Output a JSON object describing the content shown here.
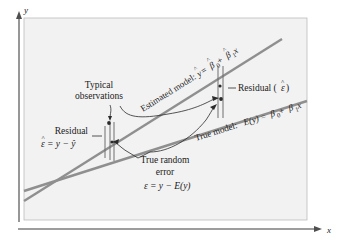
{
  "figure": {
    "background_color": "#ffffff",
    "panel_color": "#f2f2f2",
    "panel_border_color": "#b4b4b4",
    "line_color": "#8a8a8a",
    "ink_color": "#1a1a1a"
  },
  "axes": {
    "y_label": "y",
    "x_label": "x"
  },
  "lines": {
    "estimated": {
      "name": "estimated-regression-line",
      "label_prefix": "Estimated model: ",
      "label_lhs": "y",
      "label_lhs_hat": "^",
      "label_eq": " = ",
      "label_b0": "β",
      "label_b0_sub": "0",
      "label_plus": " + ",
      "label_b1": "β",
      "label_b1_sub": "1",
      "label_x": "x",
      "full_label": "Estimated model: ŷ = β̅0 + β̅1x"
    },
    "true": {
      "name": "true-regression-line",
      "label_prefix": "True model: ",
      "label_lhs": "E(y)",
      "label_eq": " = ",
      "label_b0": "β",
      "label_b0_sub": "0",
      "label_plus": " + ",
      "label_b1": "β",
      "label_b1_sub": "1",
      "label_x": "x",
      "full_label": "True model: E(y) = β₀ + β₁x"
    }
  },
  "annotations": {
    "typical_observations": {
      "line1": "Typical",
      "line2": "observations"
    },
    "residual_left": {
      "line1": "Residual",
      "line2_lhs": "ε",
      "line2_hat": "^",
      "line2_rest": " = y − ŷ",
      "full": "Residual ε̂ = y − ŷ"
    },
    "residual_right": {
      "text_prefix": "Residual (",
      "text_sym": "ε",
      "text_hat": "^",
      "text_suffix": ")",
      "full": "Residual (ε̂)"
    },
    "true_random_error": {
      "line1": "True random",
      "line2": "error",
      "line3": "ε = y − E(y)",
      "line3_sym": "ε",
      "line3_rest": " = y − E(y)"
    }
  },
  "observations": [
    {
      "name": "left-observation-point",
      "x": 109,
      "y": 124
    },
    {
      "name": "right-observation-point",
      "x": 221,
      "y": 100
    }
  ]
}
